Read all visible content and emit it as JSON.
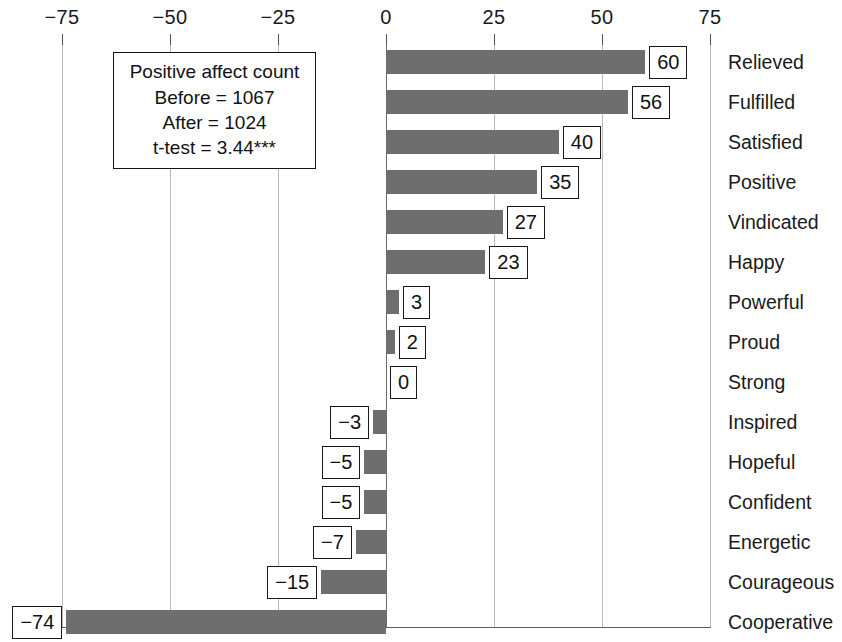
{
  "chart_data": {
    "type": "bar",
    "orientation": "horizontal",
    "title": "",
    "xlabel": "",
    "ylabel": "",
    "xlim": [
      -75,
      75
    ],
    "xticks": [
      -75,
      -50,
      -25,
      0,
      25,
      50,
      75
    ],
    "xtick_labels": [
      "−75",
      "−50",
      "−25",
      "0",
      "25",
      "50",
      "75"
    ],
    "grid": true,
    "legend": false,
    "categories": [
      "Relieved",
      "Fulfilled",
      "Satisfied",
      "Positive",
      "Vindicated",
      "Happy",
      "Powerful",
      "Proud",
      "Strong",
      "Inspired",
      "Hopeful",
      "Confident",
      "Energetic",
      "Courageous",
      "Cooperative"
    ],
    "values": [
      60,
      56,
      40,
      35,
      27,
      23,
      3,
      2,
      0,
      -3,
      -5,
      -5,
      -7,
      -15,
      -74
    ],
    "value_labels": [
      "60",
      "56",
      "40",
      "35",
      "27",
      "23",
      "3",
      "2",
      "0",
      "−3",
      "−5",
      "−5",
      "−7",
      "−15",
      "−74"
    ],
    "bar_color": "#6e6e6e",
    "annotation": {
      "lines": [
        "Positive affect count",
        "Before = 1067",
        "After = 1024",
        "t-test = 3.44***"
      ]
    }
  }
}
